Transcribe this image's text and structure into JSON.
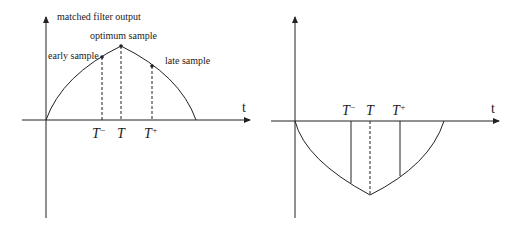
{
  "left_panel": {
    "y_axis_label": "matched filter output",
    "x_axis_label": "t",
    "annotations": {
      "optimum": "optimum sample",
      "early": "early sample",
      "late": "late sample"
    },
    "ticks": {
      "t_minus": "T",
      "t_minus_sup": "−",
      "t": "T",
      "t_plus": "T",
      "t_plus_sup": "+"
    }
  },
  "right_panel": {
    "x_axis_label": "t",
    "ticks": {
      "t_minus": "T",
      "t_minus_sup": "−",
      "t": "T",
      "t_plus": "T",
      "t_plus_sup": "+"
    }
  },
  "colors": {
    "line": "#222222",
    "background": "#ffffff"
  }
}
